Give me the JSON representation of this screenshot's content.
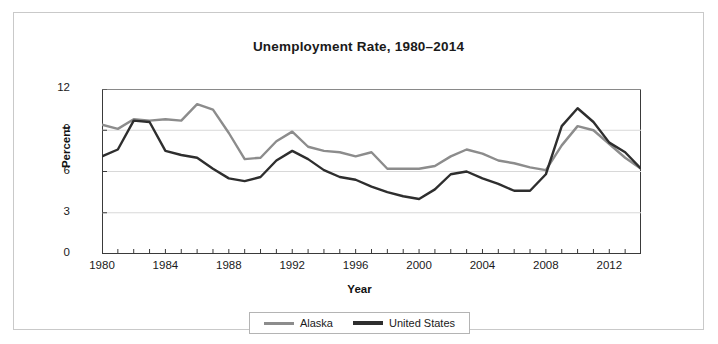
{
  "chart_data": {
    "type": "line",
    "title": "Unemployment Rate, 1980–2014",
    "xlabel": "Year",
    "ylabel": "Percent",
    "xlim": [
      1980,
      2014
    ],
    "ylim": [
      0,
      12
    ],
    "yticks": [
      "0",
      "3",
      "6",
      "9",
      "12"
    ],
    "xticks": [
      "1980",
      "1984",
      "1988",
      "1992",
      "1996",
      "2000",
      "2004",
      "2008",
      "2012"
    ],
    "grid": "horizontal",
    "legend_position": "bottom",
    "x": [
      1980,
      1981,
      1982,
      1983,
      1984,
      1985,
      1986,
      1987,
      1988,
      1989,
      1990,
      1991,
      1992,
      1993,
      1994,
      1995,
      1996,
      1997,
      1998,
      1999,
      2000,
      2001,
      2002,
      2003,
      2004,
      2005,
      2006,
      2007,
      2008,
      2009,
      2010,
      2011,
      2012,
      2013,
      2014
    ],
    "series": [
      {
        "name": "Alaska",
        "color": "#8c8c8c",
        "values": [
          9.4,
          9.1,
          9.8,
          9.7,
          9.8,
          9.7,
          10.9,
          10.5,
          8.8,
          6.9,
          7.0,
          8.2,
          8.9,
          7.8,
          7.5,
          7.4,
          7.1,
          7.4,
          6.2,
          6.2,
          6.2,
          6.4,
          7.1,
          7.6,
          7.3,
          6.8,
          6.6,
          6.3,
          6.1,
          7.9,
          9.3,
          9.0,
          8.0,
          7.0,
          6.2
        ]
      },
      {
        "name": "United States",
        "color": "#2e2e2e",
        "values": [
          7.1,
          7.6,
          9.7,
          9.6,
          7.5,
          7.2,
          7.0,
          6.2,
          5.5,
          5.3,
          5.6,
          6.8,
          7.5,
          6.9,
          6.1,
          5.6,
          5.4,
          4.9,
          4.5,
          4.2,
          4.0,
          4.7,
          5.8,
          6.0,
          5.5,
          5.1,
          4.6,
          4.6,
          5.8,
          9.3,
          10.6,
          9.6,
          8.1,
          7.4,
          6.2
        ]
      }
    ]
  },
  "legend": {
    "items": [
      {
        "label": "Alaska"
      },
      {
        "label": "United States"
      }
    ]
  }
}
